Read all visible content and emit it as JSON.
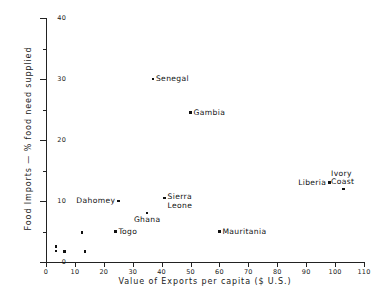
{
  "chart_data": {
    "type": "scatter",
    "title": "",
    "xlabel": "Value of Exports per capita ($ U.S.)",
    "ylabel": "Food Imports — % food need supplied",
    "xlim": [
      0,
      110
    ],
    "ylim": [
      0,
      40
    ],
    "xticks": [
      0,
      10,
      20,
      30,
      40,
      50,
      60,
      70,
      80,
      90,
      100,
      110
    ],
    "yticks": [
      0,
      10,
      20,
      30,
      40
    ],
    "yticks_minor": [
      5,
      15,
      25,
      35
    ],
    "grid": false,
    "legend": null,
    "points": [
      {
        "label": "Senegal",
        "x": 37,
        "y": 30.0,
        "label_pos": "right"
      },
      {
        "label": "Gambia",
        "x": 50,
        "y": 24.5,
        "label_pos": "right"
      },
      {
        "label": "Sierra\nLeone",
        "x": 41,
        "y": 10.5,
        "label_pos": "right"
      },
      {
        "label": "Ghana",
        "x": 35,
        "y": 8.0,
        "label_pos": "below"
      },
      {
        "label": "Dahomey",
        "x": 25,
        "y": 10.0,
        "label_pos": "left"
      },
      {
        "label": "Togo",
        "x": 24,
        "y": 5.0,
        "label_pos": "right"
      },
      {
        "label": "Mauritania",
        "x": 60,
        "y": 5.0,
        "label_pos": "right"
      },
      {
        "label": "Liberia",
        "x": 98,
        "y": 13.0,
        "label_pos": "left"
      },
      {
        "label": "Ivory\nCoast",
        "x": 103,
        "y": 12.0,
        "label_pos": "above"
      },
      {
        "label": "",
        "x": 3.5,
        "y": 2.5,
        "label_pos": "none"
      },
      {
        "label": "",
        "x": 3.5,
        "y": 1.8,
        "label_pos": "none"
      },
      {
        "label": "",
        "x": 6.5,
        "y": 1.7,
        "label_pos": "none"
      },
      {
        "label": "",
        "x": 12.5,
        "y": 4.8,
        "label_pos": "none"
      },
      {
        "label": "",
        "x": 13.5,
        "y": 1.7,
        "label_pos": "none"
      }
    ]
  },
  "axes": {
    "y_title": "Food Imports — % food need supplied",
    "x_title": "Value of Exports per capita ($ U.S.)"
  },
  "colors": {
    "marker": "#111111",
    "axis": "#222222",
    "background": "#ffffff"
  }
}
